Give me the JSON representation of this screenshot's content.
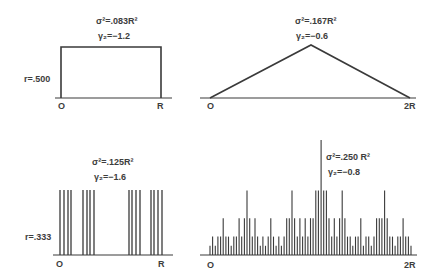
{
  "panels": [
    {
      "id": "top-left",
      "sigma_label": "σ²=.083R²",
      "gamma_label": "γ₂=−1.2",
      "r_label": "r=.500",
      "x_start_label": "O",
      "x_end_label": "R",
      "shape": "rectangle"
    },
    {
      "id": "top-right",
      "sigma_label": "σ²=.167R²",
      "gamma_label": "γ₂=−0.6",
      "x_start_label": "O",
      "x_end_label": "2R",
      "shape": "triangle"
    },
    {
      "id": "bottom-left",
      "sigma_label": "σ²=.125R²",
      "gamma_label": "γ₂=−1.6",
      "r_label": "r=.333",
      "x_start_label": "O",
      "x_end_label": "R",
      "shape": "spike-groups"
    },
    {
      "id": "bottom-right",
      "sigma_label": "σ²=.250 R²",
      "gamma_label": "γ₂=−0.8",
      "x_start_label": "O",
      "x_end_label": "2R",
      "shape": "spike-field"
    }
  ],
  "chart_data": [
    {
      "type": "area",
      "title": "Uniform distribution on [0,R]",
      "annotations": [
        "σ²=.083R²",
        "γ₂=−1.2",
        "r=.500"
      ],
      "x": [
        0,
        0,
        1,
        1
      ],
      "y": [
        0,
        1,
        1,
        0
      ],
      "xticks": [
        "O",
        "R"
      ]
    },
    {
      "type": "line",
      "title": "Triangular distribution on [0,2R]",
      "annotations": [
        "σ²=.167R²",
        "γ₂=−0.6"
      ],
      "x": [
        0,
        1,
        2
      ],
      "y": [
        0,
        1,
        0
      ],
      "xticks": [
        "O",
        "2R"
      ]
    },
    {
      "type": "bar",
      "title": "Discrete spikes on [0,R]",
      "annotations": [
        "σ²=.125R²",
        "γ₂=−1.6",
        "r=.333"
      ],
      "x": [
        0.03,
        0.06,
        0.09,
        0.12,
        0.25,
        0.28,
        0.31,
        0.34,
        0.66,
        0.69,
        0.72,
        0.75,
        0.88,
        0.91,
        0.94,
        0.97
      ],
      "y": [
        1,
        1,
        1,
        1,
        1,
        1,
        1,
        1,
        1,
        1,
        1,
        1,
        1,
        1,
        1,
        1
      ],
      "xticks": [
        "O",
        "R"
      ]
    },
    {
      "type": "bar",
      "title": "Discrete spike convolution on [0,2R]",
      "annotations": [
        "σ²=.250 R²",
        "γ₂=−0.8"
      ],
      "heights_relative": [
        1,
        2,
        1,
        2,
        2,
        4,
        2,
        2,
        1,
        2,
        2,
        4,
        2,
        4,
        7,
        4,
        2,
        4,
        2,
        1,
        2,
        1,
        2,
        4,
        2,
        1,
        2,
        1,
        2,
        4,
        4,
        7,
        4,
        2,
        4,
        2,
        4,
        2,
        4,
        4,
        7,
        7,
        16,
        7,
        7,
        4,
        2,
        4,
        2,
        4,
        7,
        4,
        2,
        2,
        1,
        2,
        2,
        4,
        1,
        2,
        2,
        1,
        2,
        4,
        4,
        4,
        7,
        4,
        2,
        2,
        1,
        2,
        2,
        4,
        2,
        2,
        1
      ],
      "xticks": [
        "O",
        "2R"
      ]
    }
  ]
}
